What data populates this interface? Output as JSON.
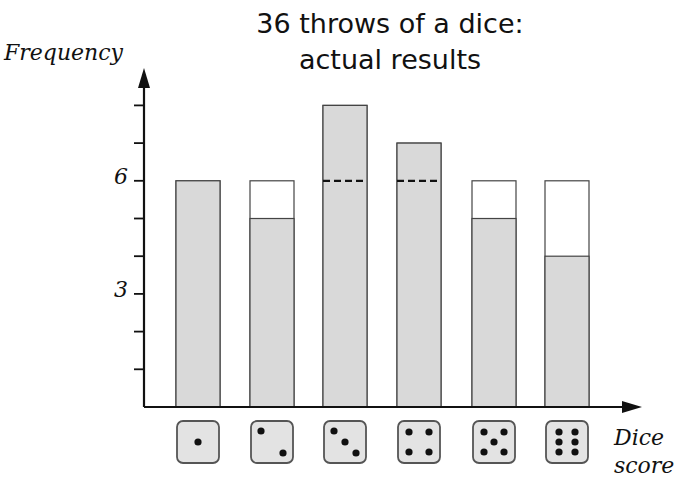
{
  "chart_data": {
    "type": "bar",
    "title": "36 throws of a dice: actual results",
    "title_lines": [
      "36 throws of a dice:",
      "actual results"
    ],
    "xlabel": "Dice score",
    "xlabel_lines": [
      "Dice",
      "score"
    ],
    "ylabel": "Frequency",
    "categories": [
      "1",
      "2",
      "3",
      "4",
      "5",
      "6"
    ],
    "category_icons": [
      "die-face-1",
      "die-face-2",
      "die-face-3",
      "die-face-4",
      "die-face-5",
      "die-face-6"
    ],
    "series": [
      {
        "name": "Actual frequency",
        "values": [
          6,
          5,
          8,
          7,
          5,
          4
        ],
        "color": "#d9d9d9"
      },
      {
        "name": "Expected frequency",
        "values": [
          6,
          6,
          6,
          6,
          6,
          6
        ],
        "style": "outline / dashed line where exceeded"
      }
    ],
    "y_ticks": [
      1,
      2,
      3,
      4,
      5,
      6,
      7,
      8
    ],
    "y_tick_labels": [
      {
        "value": 3,
        "label": "3"
      },
      {
        "value": 6,
        "label": "6"
      }
    ],
    "ylim": [
      0,
      8.5
    ],
    "grid": false,
    "legend": "none"
  },
  "labels": {
    "title1": "36 throws of a dice:",
    "title2": "actual results",
    "ylabel": "Frequency",
    "y3": "3",
    "y6": "6",
    "xlabel1": "Dice",
    "xlabel2": "score"
  }
}
